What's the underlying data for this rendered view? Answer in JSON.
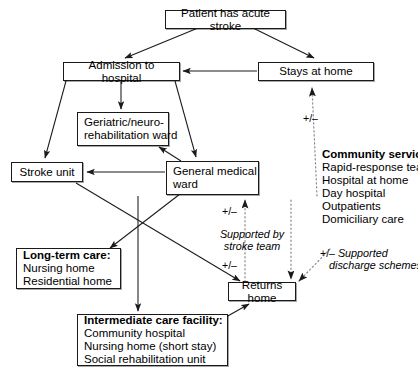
{
  "diagram": {
    "title_text": "Patient has acute stroke",
    "nodes": {
      "acute_stroke": "Patient has acute stroke",
      "admission": "Admission to hospital",
      "stays_home": "Stays at home",
      "geriatric_l1": "Geriatric/neuro-",
      "geriatric_l2": "rehabilitation ward",
      "stroke_unit": "Stroke unit",
      "general_ward_l1": "General medical",
      "general_ward_l2": "ward",
      "returns_home": "Returns home",
      "longterm_header": "Long-term care:",
      "longterm_item1": "Nursing home",
      "longterm_item2": "Residential home",
      "intermediate_header": "Intermediate care facility:",
      "intermediate_item1": "Community hospital",
      "intermediate_item2": "Nursing home (short stay)",
      "intermediate_item3": "Social rehabilitation unit"
    },
    "annotations": {
      "community_header": "Community services:",
      "community_item1": "Rapid-response team",
      "community_item2": "Hospital at home",
      "community_item3": "Day hospital",
      "community_item4": "Outpatients",
      "community_item5": "Domiciliary care",
      "supported_by_l1": "Supported by",
      "supported_by_l2": "stroke team",
      "discharge_l1": "Supported",
      "discharge_l2": "discharge schemes",
      "sign_home_top": "+/–",
      "sign_stroke_top": "+/–",
      "sign_stroke_bottom": "+/–",
      "sign_discharge": "+/–"
    },
    "colors": {
      "stroke": "#1a1a1a",
      "background": "#ffffff",
      "dotted": "#8c8c8c"
    }
  }
}
